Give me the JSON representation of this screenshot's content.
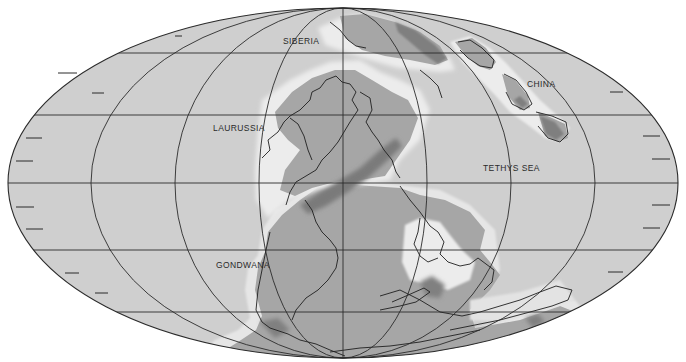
{
  "map": {
    "projection": "mollweide",
    "colors": {
      "ocean": "#cfcfcf",
      "land": "#a6a6a6",
      "shelf": "#e9e9e9",
      "mountain": "#7f7f7f",
      "line": "#2b2b2b",
      "background": "#ffffff"
    },
    "labels": [
      {
        "id": "siberia",
        "text": "SIBERIA"
      },
      {
        "id": "china",
        "text": "CHINA"
      },
      {
        "id": "laurussia",
        "text": "LAURUSSIA"
      },
      {
        "id": "tethys-sea",
        "text": "TETHYS SEA"
      },
      {
        "id": "gondwana",
        "text": "GONDWANA"
      }
    ]
  }
}
